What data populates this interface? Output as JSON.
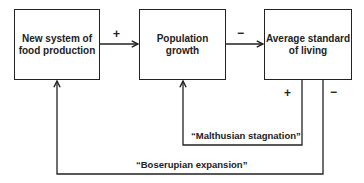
{
  "diagram": {
    "type": "causal-loop",
    "nodes": [
      {
        "id": "food",
        "label": "New system of food production"
      },
      {
        "id": "population",
        "label": "Population growth"
      },
      {
        "id": "living",
        "label": "Average standard of living"
      }
    ],
    "node_labels": {
      "food_line1": "New system of",
      "food_line2": "food production",
      "population_line1": "Population",
      "population_line2": "growth",
      "living_line1": "Average standard",
      "living_line2": "of living"
    },
    "edges": [
      {
        "from": "food",
        "to": "population",
        "sign": "+"
      },
      {
        "from": "population",
        "to": "living",
        "sign": "−"
      },
      {
        "from": "living",
        "to": "population",
        "sign": "+",
        "loop": "Malthusian stagnation"
      },
      {
        "from": "living",
        "to": "food",
        "sign": "−",
        "loop": "Boserupian expansion"
      }
    ],
    "signs": {
      "food_to_population": "+",
      "population_to_living": "−",
      "malthusian": "+",
      "boserupian": "−"
    },
    "loops": {
      "malthusian": "“Malthusian stagnation”",
      "boserupian": "“Boserupian expansion”"
    },
    "colors": {
      "line": "#222222",
      "background": "#ffffff"
    }
  }
}
